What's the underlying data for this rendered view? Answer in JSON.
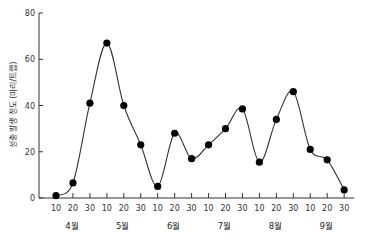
{
  "chart_data": {
    "type": "line",
    "title": "",
    "xlabel": "",
    "ylabel": "성충 발생 정도 (마리/트랩)",
    "ylim": [
      0,
      80
    ],
    "yticks": [
      0,
      20,
      40,
      60,
      80
    ],
    "grid": false,
    "legend": null,
    "smooth": true,
    "marker": "filled-circle",
    "months": [
      "4월",
      "5월",
      "6월",
      "7월",
      "8월",
      "9월"
    ],
    "x_tick_labels": [
      "10",
      "20",
      "30",
      "10",
      "20",
      "30",
      "10",
      "20",
      "30",
      "10",
      "20",
      "30",
      "10",
      "20",
      "30",
      "10",
      "20",
      "30"
    ],
    "categories": [
      "4/10",
      "4/20",
      "4/30",
      "5/10",
      "5/20",
      "5/30",
      "6/10",
      "6/20",
      "6/30",
      "7/10",
      "7/20",
      "7/30",
      "8/10",
      "8/20",
      "8/30",
      "9/10",
      "9/20",
      "9/30"
    ],
    "series": [
      {
        "name": "성충 발생 정도",
        "values": [
          1,
          6.5,
          41,
          67,
          40,
          23,
          5,
          28,
          17,
          23,
          30,
          38.5,
          15.5,
          34,
          46,
          21,
          16.5,
          3.5
        ]
      }
    ]
  },
  "colors": {
    "line": "#333333",
    "marker": "#000000",
    "axis": "#333333"
  }
}
